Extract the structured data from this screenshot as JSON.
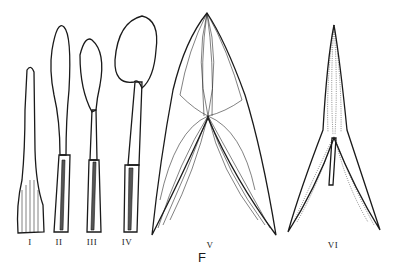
{
  "figure": {
    "letter": "F",
    "colors": {
      "ink": "#1a1a1a",
      "background": "#ffffff"
    },
    "items": [
      {
        "label": "I",
        "shape": "linear-spatulate leaf, fine reticulate venation"
      },
      {
        "label": "II",
        "shape": "oblanceolate blade on sheathing petiole"
      },
      {
        "label": "III",
        "shape": "elliptic blade on sheathing petiole"
      },
      {
        "label": "IV",
        "shape": "cordate-ovate blade on sheathing petiole"
      },
      {
        "label": "V",
        "shape": "sagittate leaf with curved parallel veins"
      },
      {
        "label": "VI",
        "shape": "narrow sagittate leaf with petiole"
      }
    ]
  }
}
